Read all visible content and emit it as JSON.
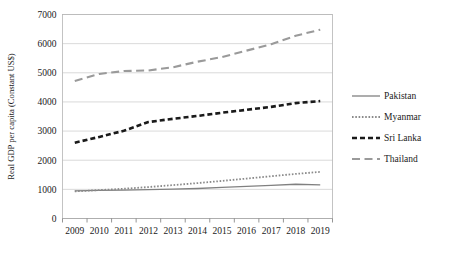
{
  "chart_data": {
    "type": "line",
    "title": "",
    "xlabel": "",
    "ylabel": "Real GDP per capita (Constant US$)",
    "x": [
      2009,
      2010,
      2011,
      2012,
      2013,
      2014,
      2015,
      2016,
      2017,
      2018,
      2019
    ],
    "categories": [
      "2009",
      "2010",
      "2011",
      "2012",
      "2013",
      "2014",
      "2015",
      "2016",
      "2017",
      "2018",
      "2019"
    ],
    "ylim": [
      0,
      7000
    ],
    "ytick_values": [
      0,
      1000,
      2000,
      3000,
      4000,
      5000,
      6000,
      7000
    ],
    "ytick_labels": [
      "0",
      "1000",
      "2000",
      "3000",
      "4000",
      "5000",
      "6000",
      "7000"
    ],
    "grid": true,
    "legend_position": "right",
    "series": [
      {
        "name": "Pakistan",
        "style": "solid",
        "color": "#808080",
        "values": [
          950,
          965,
          975,
          990,
          1005,
          1030,
          1065,
          1100,
          1140,
          1175,
          1155
        ]
      },
      {
        "name": "Myanmar",
        "style": "dotted",
        "color": "#8a8a8a",
        "values": [
          930,
          975,
          1020,
          1080,
          1145,
          1215,
          1290,
          1370,
          1450,
          1530,
          1600
        ]
      },
      {
        "name": "Sri Lanka",
        "style": "dashed",
        "color": "#1a1a1a",
        "values": [
          2600,
          2800,
          3010,
          3310,
          3420,
          3520,
          3630,
          3730,
          3830,
          3960,
          4030
        ]
      },
      {
        "name": "Thailand",
        "style": "longdash",
        "color": "#9a9a9a",
        "values": [
          4720,
          4960,
          5060,
          5080,
          5190,
          5380,
          5540,
          5760,
          5980,
          6270,
          6480
        ]
      }
    ]
  },
  "legend": {
    "items": [
      {
        "label": "Pakistan"
      },
      {
        "label": "Myanmar"
      },
      {
        "label": "Sri Lanka"
      },
      {
        "label": "Thailand"
      }
    ]
  }
}
